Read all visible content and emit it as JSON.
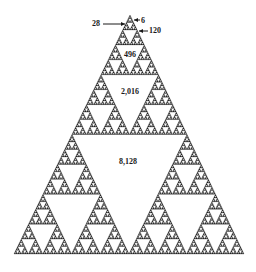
{
  "figure": {
    "fill_color": "#222222",
    "background_color": "#ffffff",
    "apex": [
      130,
      15
    ],
    "base_left": [
      14,
      254
    ],
    "base_right": [
      244,
      254
    ],
    "depth": 7
  },
  "labels": [
    {
      "id": "label-6",
      "text": "6",
      "x": 143,
      "y": 21
    },
    {
      "id": "label-28",
      "text": "28",
      "x": 96,
      "y": 24
    },
    {
      "id": "label-120",
      "text": "120",
      "x": 155,
      "y": 31
    },
    {
      "id": "label-496",
      "text": "496",
      "x": 130,
      "y": 55
    },
    {
      "id": "label-2016",
      "text": "2,016",
      "x": 130,
      "y": 92
    },
    {
      "id": "label-8128",
      "text": "8,128",
      "x": 128,
      "y": 162
    }
  ],
  "arrows": [
    {
      "id": "arrow-28",
      "from": [
        103,
        24
      ],
      "to": [
        125,
        24
      ]
    },
    {
      "id": "arrow-6",
      "from": [
        140,
        20
      ],
      "to": [
        134,
        20
      ]
    },
    {
      "id": "arrow-120",
      "from": [
        148,
        31
      ],
      "to": [
        139,
        31
      ]
    }
  ]
}
